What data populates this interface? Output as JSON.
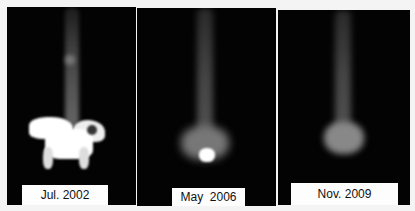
{
  "figure": {
    "panels": [
      {
        "label": "Jul. 2002"
      },
      {
        "label": "May  2006"
      },
      {
        "label": "Nov. 2009"
      }
    ]
  }
}
